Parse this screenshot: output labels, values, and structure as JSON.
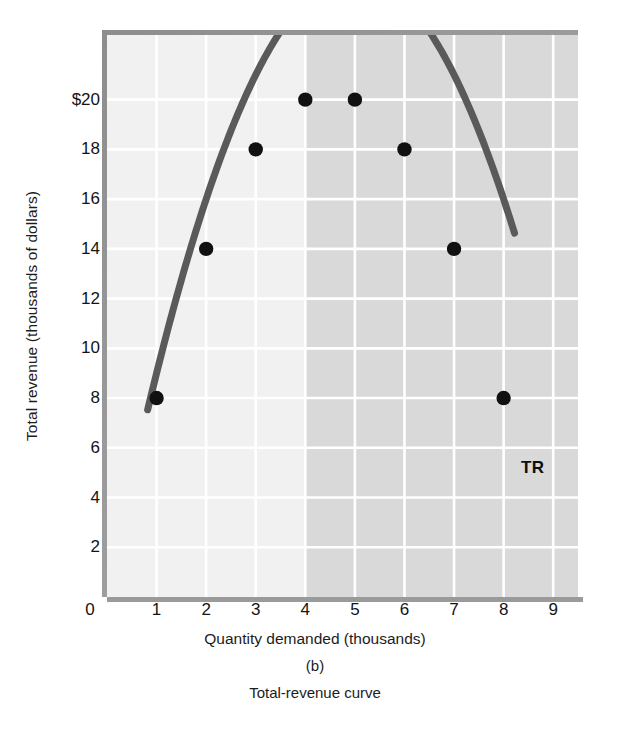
{
  "chart_data": {
    "type": "line",
    "title": "Total-revenue curve",
    "panel_label": "(b)",
    "xlabel": "Quantity demanded (thousands)",
    "ylabel": "Total revenue (thousands of dollars)",
    "xlim": [
      0,
      9.5
    ],
    "ylim": [
      0,
      22.6
    ],
    "xticks": [
      0,
      1,
      2,
      3,
      4,
      5,
      6,
      7,
      8,
      9
    ],
    "xtick_labels": [
      "0",
      "1",
      "2",
      "3",
      "4",
      "5",
      "6",
      "7",
      "8",
      "9"
    ],
    "yticks": [
      2,
      4,
      6,
      8,
      10,
      12,
      14,
      16,
      18,
      20
    ],
    "ytick_labels": [
      "2",
      "4",
      "6",
      "8",
      "10",
      "12",
      "14",
      "16",
      "18",
      "$20"
    ],
    "grid": true,
    "legend": "none",
    "series": [
      {
        "name": "TR",
        "label": "TR",
        "equation": "TR = 10q - q^2",
        "curve_x_start": 0.82,
        "curve_x_end": 8.22,
        "x": [
          1,
          2,
          3,
          4,
          5,
          6,
          7,
          8
        ],
        "values": [
          8,
          14,
          18,
          20,
          20,
          18,
          14,
          8
        ],
        "marker": "filled-circle"
      }
    ],
    "annotations": [
      {
        "text": "TR",
        "x": 8.35,
        "y": 5.2,
        "bold": true
      }
    ],
    "shaded_band": {
      "x_start": 4,
      "x_end": 9.5,
      "light_color": "#f1f1f1",
      "dark_color": "#d9d9d9"
    },
    "colors": {
      "curve": "#5a5a5a",
      "marker": "#111111",
      "gridline": "#ffffff",
      "plot_background_light": "#f1f1f1",
      "plot_background_dark": "#d9d9d9",
      "frame": "#9a9a9a",
      "text": "#1a1a1a"
    }
  }
}
